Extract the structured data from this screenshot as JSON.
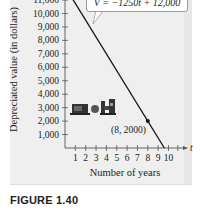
{
  "chart_data": {
    "type": "line",
    "title": "",
    "xlabel": "Number of years",
    "ylabel": "Depreciated value (in dollars)",
    "x_axis_variable": "t",
    "x_ticks": [
      1,
      2,
      3,
      4,
      5,
      6,
      7,
      8,
      9,
      10
    ],
    "y_ticks": [
      1000,
      2000,
      3000,
      4000,
      5000,
      6000,
      7000,
      8000,
      9000,
      10000,
      11000
    ],
    "y_tick_labels": [
      "1,000",
      "2,000",
      "3,000",
      "4,000",
      "5,000",
      "6,000",
      "7,000",
      "8,000",
      "9,000",
      "10,000",
      "11,000"
    ],
    "xlim": [
      0,
      11
    ],
    "ylim": [
      0,
      11000
    ],
    "grid": false,
    "series": [
      {
        "name": "V = -1250t + 12,000",
        "x": [
          0,
          9.6
        ],
        "y": [
          12000,
          0
        ],
        "slope": -1250,
        "intercept": 12000
      }
    ],
    "annotations": [
      {
        "type": "point",
        "x": 8,
        "y": 2000,
        "label": "(8, 2000)"
      },
      {
        "type": "callout",
        "text": "V = −1250t + 12,000"
      },
      {
        "type": "icon",
        "name": "machinery-illustration"
      }
    ],
    "caption": "FIGURE 1.40"
  },
  "labels": {
    "ylabel": "Depreciated value (in dollars)",
    "xlabel": "Number of years",
    "equation": "V = −1250t + 12,000",
    "point": "(8, 2000)",
    "axis_var": "t",
    "caption": "FIGURE 1.40"
  }
}
